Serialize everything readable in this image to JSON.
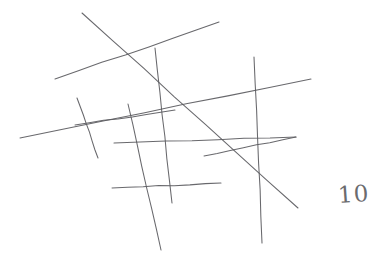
{
  "page": {
    "kind": "hand-drawn-line-figure",
    "width": 381,
    "height": 263,
    "background_color": "#ffffff",
    "ink_color": "#5b5b5f",
    "annotation_label": "10"
  },
  "chart_data": {
    "type": "scatter",
    "title": "",
    "subtitle": "",
    "xlabel": "",
    "ylabel": "",
    "grid": false,
    "legend": "none",
    "xlim": [
      0,
      381
    ],
    "ylim": [
      0,
      263
    ],
    "line_count": 11,
    "lines": [
      {
        "name": "long-diagonal-down-right",
        "x1": 82,
        "y1": 13,
        "x2": 298,
        "y2": 208
      },
      {
        "name": "upper-left-rising-line",
        "x1": 55,
        "y1": 79,
        "x2": 219,
        "y2": 22
      },
      {
        "name": "mid-left-rising-line",
        "x1": 20,
        "y1": 138,
        "x2": 311,
        "y2": 79
      },
      {
        "name": "inner-upper-short-rise",
        "x1": 75,
        "y1": 125,
        "x2": 175,
        "y2": 110
      },
      {
        "name": "inner-lower-rising-line",
        "x1": 114,
        "y1": 143,
        "x2": 296,
        "y2": 137
      },
      {
        "name": "right-lower-rising-line",
        "x1": 204,
        "y1": 156,
        "x2": 296,
        "y2": 137
      },
      {
        "name": "bottom-horizontal-line",
        "x1": 112,
        "y1": 188,
        "x2": 221,
        "y2": 183
      },
      {
        "name": "short-steep-left-line",
        "x1": 77,
        "y1": 98,
        "x2": 98,
        "y2": 158
      },
      {
        "name": "steep-line-center-left",
        "x1": 128,
        "y1": 104,
        "x2": 161,
        "y2": 250
      },
      {
        "name": "steep-line-center-right",
        "x1": 155,
        "y1": 48,
        "x2": 172,
        "y2": 203
      },
      {
        "name": "steep-line-right",
        "x1": 254,
        "y1": 57,
        "x2": 262,
        "y2": 243
      }
    ],
    "annotations": [
      {
        "name": "handwritten-ten",
        "text": "10",
        "x": 338,
        "y": 183
      }
    ]
  }
}
